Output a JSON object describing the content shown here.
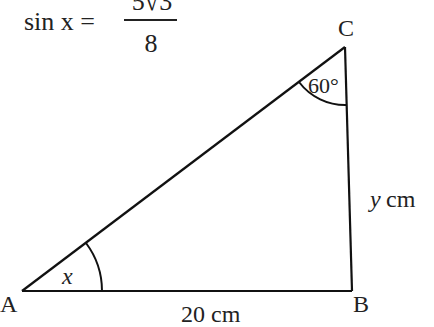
{
  "equation": {
    "lhs": "sin x =",
    "numerator": "5√3",
    "denominator": "8"
  },
  "triangle": {
    "vertices": {
      "A": "A",
      "B": "B",
      "C": "C"
    },
    "angle_A_label": "x",
    "angle_C_label": "60°",
    "side_AB_label": "20 cm",
    "side_BC_var": "y",
    "side_BC_unit": "cm"
  }
}
